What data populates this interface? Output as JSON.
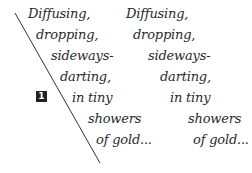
{
  "badge": {
    "label": "1",
    "color": "#222222"
  },
  "poem_left": {
    "lines": [
      "Diffusing,",
      "dropping,",
      "sideways-",
      "darting,",
      "in tiny",
      "showers",
      "of gold..."
    ]
  },
  "poem_right": {
    "lines": [
      "Diffusing,",
      "dropping,",
      "sideways-",
      "darting,",
      "in tiny",
      "showers",
      "of gold..."
    ]
  },
  "colors": {
    "text": "#2a2a2a",
    "line": "#333333",
    "background": "#ffffff"
  }
}
